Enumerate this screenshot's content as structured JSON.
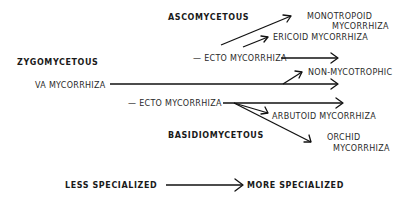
{
  "diagram": {
    "groups": {
      "ascomycetous": "ASCOMYCETOUS",
      "zygomycetous": "ZYGOMYCETOUS",
      "basidiomycetous": "BASIDIOMYCETOUS"
    },
    "nodes": {
      "asco_ecto": "— ECTO MYCORRHIZA",
      "monotropoid_line1": "MONOTROPOID",
      "monotropoid_line2": "MYCORRHIZA",
      "ericoid": "ERICOID  MYCORRHIZA",
      "va": "VA MYCORRHIZA",
      "non_mycotrophic": "NON-MYCOTROPHIC",
      "basidio_ecto": "— ECTO MYCORRHIZA",
      "arbutoid": "ARBUTOID  MYCORRHIZA",
      "orchid_line1": "ORCHID",
      "orchid_line2": "MYCORRHIZA"
    },
    "axis": {
      "start": "LESS SPECIALIZED",
      "end": "MORE SPECIALIZED"
    },
    "colors": {
      "ink": "#111111",
      "background": "#ffffff"
    }
  }
}
